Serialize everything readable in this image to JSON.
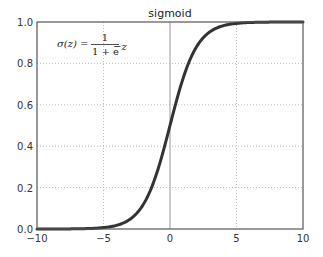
{
  "chart_data": {
    "type": "line",
    "title": "sigmoid",
    "xlabel": "",
    "ylabel": "",
    "xlim": [
      -10,
      10
    ],
    "ylim": [
      0.0,
      1.0
    ],
    "x_ticks": [
      "−10",
      "−5",
      "0",
      "5",
      "10"
    ],
    "x_tick_values": [
      -10,
      -5,
      0,
      5,
      10
    ],
    "y_ticks": [
      "0.0",
      "0.2",
      "0.4",
      "0.6",
      "0.8",
      "1.0"
    ],
    "y_tick_values": [
      0.0,
      0.2,
      0.4,
      0.6,
      0.8,
      1.0
    ],
    "grid": true,
    "grid_style": "dotted",
    "zero_line": {
      "x": 0,
      "style": "solid"
    },
    "annotation": {
      "lhs": "σ(z) =",
      "numerator": "1",
      "denominator": "1 + e",
      "exponent": "−z"
    },
    "series": [
      {
        "name": "sigmoid",
        "function": "1/(1+exp(-z))",
        "color": "#333333",
        "x": [
          -10,
          -8,
          -6,
          -5,
          -4,
          -3,
          -2,
          -1,
          0,
          1,
          2,
          3,
          4,
          5,
          6,
          8,
          10
        ],
        "values": [
          0.0,
          0.0003,
          0.0025,
          0.0067,
          0.018,
          0.047,
          0.119,
          0.269,
          0.5,
          0.731,
          0.881,
          0.953,
          0.982,
          0.993,
          0.9975,
          0.9997,
          1.0
        ]
      }
    ],
    "legend": null
  },
  "colors": {
    "curve": "#333333",
    "axes": "#555555",
    "grid": "#bbbbbb",
    "zero_line": "#999999"
  }
}
